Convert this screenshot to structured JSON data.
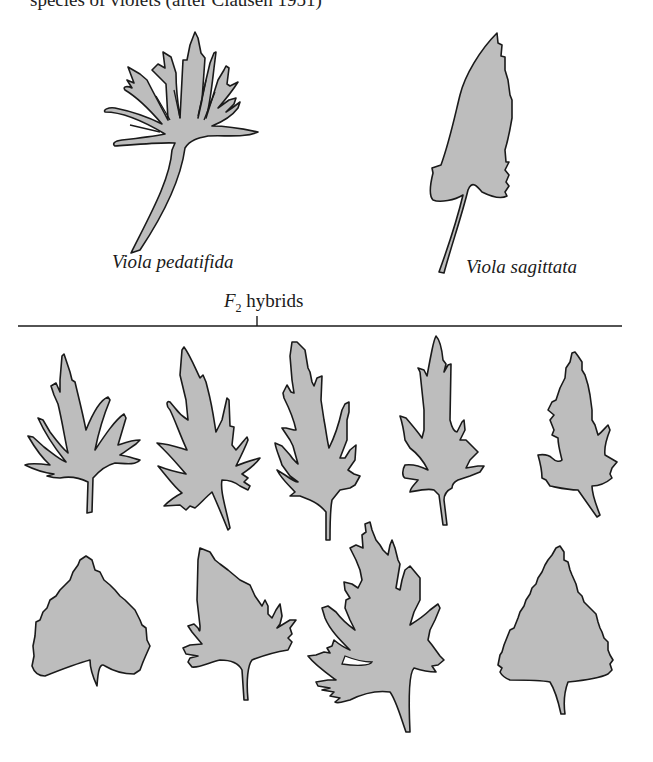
{
  "figure": {
    "clipped_caption": "species of violets (after Clausen 1951)",
    "parents": [
      {
        "id": "pedatifida",
        "label": "Viola pedatifida"
      },
      {
        "id": "sagittata",
        "label": "Viola sagittata"
      }
    ],
    "hybrids_label": {
      "prefix": "F",
      "subscript": "2",
      "suffix": " hybrids"
    },
    "hybrid_leaves": [
      {
        "row": 1,
        "index": 1
      },
      {
        "row": 1,
        "index": 2
      },
      {
        "row": 1,
        "index": 3
      },
      {
        "row": 1,
        "index": 4
      },
      {
        "row": 1,
        "index": 5
      },
      {
        "row": 2,
        "index": 1
      },
      {
        "row": 2,
        "index": 2
      },
      {
        "row": 2,
        "index": 3
      },
      {
        "row": 2,
        "index": 4
      }
    ],
    "colors": {
      "leaf_fill": "#bdbdbd",
      "outline": "#1a1a1a",
      "background": "#ffffff"
    }
  }
}
